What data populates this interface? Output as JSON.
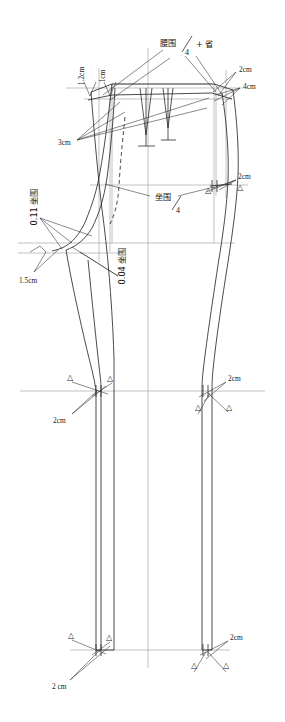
{
  "figure": {
    "type": "technical-pattern-drawing",
    "canvas": {
      "width": 285,
      "height": 722
    },
    "background_color": "#ffffff",
    "line_color": "#2b2b2b",
    "guide_color": "#8a8a8a",
    "text_color": "#141414"
  },
  "labels": {
    "waist_formula": {
      "numerator": "腰围",
      "denominator": "4",
      "suffix": "+ 省"
    },
    "hip_formula": {
      "numerator": "坐围",
      "denominator": "4"
    },
    "left_rise_a": "0.11 坐围",
    "left_rise_b": "0.04 坐围",
    "waist_left_1": "1.2cm",
    "waist_left_2": "1cm",
    "waist_left_3": "3cm",
    "waist_right_1": "2cm",
    "waist_right_2": "4cm",
    "hip_right": "2cm",
    "side_left": "1.5cm",
    "knee_left": "2cm",
    "knee_right": "2cm",
    "hem_left": "2 cm",
    "hem_right": "2cm",
    "marker_triangle": "△"
  },
  "measurements": [
    {
      "id": "waist-left-1",
      "value": "1.2cm",
      "x": 79,
      "y": 76,
      "rotated": true
    },
    {
      "id": "waist-left-2",
      "value": "1cm",
      "x": 100,
      "y": 76,
      "rotated": true
    },
    {
      "id": "waist-left-3",
      "value": "3cm",
      "x": 62,
      "y": 143,
      "rotated": false
    },
    {
      "id": "waist-right-1",
      "value": "2cm",
      "x": 240,
      "y": 70,
      "rotated": false
    },
    {
      "id": "waist-right-2",
      "value": "4cm",
      "x": 244,
      "y": 87,
      "rotated": false
    },
    {
      "id": "hip-right",
      "value": "2cm",
      "x": 240,
      "y": 178,
      "rotated": false
    },
    {
      "id": "side-left",
      "value": "1.5cm",
      "x": 22,
      "y": 281,
      "rotated": false
    },
    {
      "id": "rise-a",
      "value": "0.11 坐围",
      "x": 34,
      "y": 205,
      "rotated": true
    },
    {
      "id": "rise-b",
      "value": "0.04 坐围",
      "x": 123,
      "y": 262,
      "rotated": true
    },
    {
      "id": "knee-left",
      "value": "2cm",
      "x": 57,
      "y": 421,
      "rotated": false
    },
    {
      "id": "knee-right",
      "value": "2cm",
      "x": 229,
      "y": 380,
      "rotated": false
    },
    {
      "id": "hem-left",
      "value": "2 cm",
      "x": 57,
      "y": 686,
      "rotated": false
    },
    {
      "id": "hem-right",
      "value": "2cm",
      "x": 232,
      "y": 639,
      "rotated": false
    }
  ],
  "notch_markers": [
    {
      "id": "hip-right-upper",
      "x": 208,
      "y": 190
    },
    {
      "id": "hip-right-lower",
      "x": 240,
      "y": 187
    },
    {
      "id": "knee-left-a",
      "x": 70,
      "y": 377
    },
    {
      "id": "knee-left-b",
      "x": 110,
      "y": 378
    },
    {
      "id": "knee-right-a",
      "x": 198,
      "y": 407
    },
    {
      "id": "knee-right-b",
      "x": 229,
      "y": 407
    },
    {
      "id": "hem-left-a",
      "x": 71,
      "y": 635
    },
    {
      "id": "hem-left-b",
      "x": 109,
      "y": 637
    },
    {
      "id": "hem-right-a",
      "x": 194,
      "y": 665
    },
    {
      "id": "hem-right-b",
      "x": 226,
      "y": 665
    }
  ],
  "guide_lines": {
    "waist_line_y": 88,
    "hip_line_y": 185,
    "crotch_line_y": 243,
    "knee_line_y": 391,
    "hem_line_y": 650,
    "center_grain_x": 148
  }
}
